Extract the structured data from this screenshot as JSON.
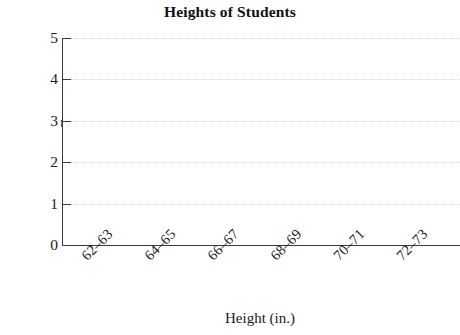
{
  "chart_data": {
    "type": "bar",
    "title": "Heights of Students",
    "subtitle": "",
    "xlabel": "Height (in.)",
    "ylabel": "Frequency",
    "categories": [
      "62–63",
      "64–65",
      "66–67",
      "68–69",
      "70–71",
      "72–73"
    ],
    "values": [
      null,
      null,
      null,
      null,
      null,
      null
    ],
    "series": [
      {
        "name": "Frequency",
        "values": [
          null,
          null,
          null,
          null,
          null,
          null
        ]
      }
    ],
    "ylim": [
      0,
      5
    ],
    "ytick_labels": [
      "5",
      "4",
      "3",
      "2",
      "1",
      "0"
    ],
    "ytick_values": [
      5,
      4,
      3,
      2,
      1,
      0
    ],
    "xtick_labels": [
      "62–63",
      "64–65",
      "66–67",
      "68–69",
      "70–71",
      "72–73"
    ],
    "grid": true,
    "grid_axis": "y",
    "grid_style": "dotted",
    "legend": false,
    "legend_position": "none",
    "colors": {
      "axis": "#3a3a3a",
      "grid": "#d8d8d8",
      "text": "#1a1a1a",
      "background": "#ffffff"
    }
  }
}
